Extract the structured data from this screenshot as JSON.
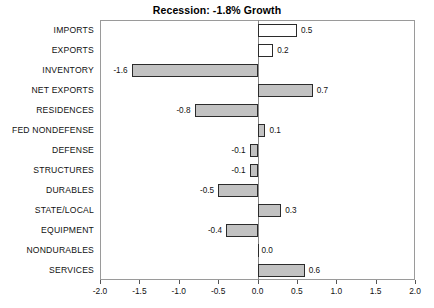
{
  "chart_data": {
    "type": "bar",
    "orientation": "horizontal",
    "title": "Recession: -1.8% Growth",
    "xlabel": "",
    "ylabel": "",
    "xlim": [
      -2.0,
      2.0
    ],
    "grid": false,
    "legend": "none",
    "xticks": [
      "-2.0",
      "-1.5",
      "-1.0",
      "-0.5",
      "0.0",
      "0.5",
      "1.0",
      "1.5",
      "2.0"
    ],
    "xtick_values": [
      -2.0,
      -1.5,
      -1.0,
      -0.5,
      0.0,
      0.5,
      1.0,
      1.5,
      2.0
    ],
    "categories": [
      "IMPORTS",
      "EXPORTS",
      "INVENTORY",
      "NET EXPORTS",
      "RESIDENCES",
      "FED NONDEFENSE",
      "DEFENSE",
      "STRUCTURES",
      "DURABLES",
      "STATE/LOCAL",
      "EQUIPMENT",
      "NONDURABLES",
      "SERVICES"
    ],
    "values": [
      0.5,
      0.2,
      -1.6,
      0.7,
      -0.8,
      0.1,
      -0.1,
      -0.1,
      -0.5,
      0.3,
      -0.4,
      0.0,
      0.6
    ],
    "value_labels": [
      "0.5",
      "0.2",
      "-1.6",
      "0.7",
      "-0.8",
      "0.1",
      "-0.1",
      "-0.1",
      "-0.5",
      "0.3",
      "-0.4",
      "0.0",
      "0.6"
    ],
    "bar_styles": [
      "hollow",
      "hollow",
      "filled",
      "filled",
      "filled",
      "filled",
      "filled",
      "filled",
      "filled",
      "filled",
      "filled",
      "filled",
      "filled"
    ],
    "colors": {
      "bar_fill": "#c2c2c2",
      "bar_hollow_fill": "#ffffff",
      "bar_edge": "#2b2b2b",
      "frame": "#9a9a9a",
      "text": "#111111",
      "background": "#ffffff"
    }
  }
}
